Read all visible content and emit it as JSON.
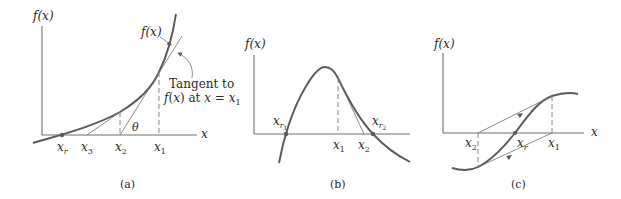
{
  "figure": {
    "panels": [
      {
        "id": "a",
        "caption": "(a)",
        "y_axis_label": "f(x)",
        "x_axis_label": "x",
        "curve_label": "f(x)",
        "tangent_label_line1": "Tangent to",
        "tangent_label_line2": "f(x) at x = x",
        "tangent_label_sub": "1",
        "angle_label": "θ",
        "points": {
          "xr": {
            "base": "x",
            "sub": "r"
          },
          "x3": {
            "base": "x",
            "sub": "3"
          },
          "x2": {
            "base": "x",
            "sub": "2"
          },
          "x1": {
            "base": "x",
            "sub": "1"
          }
        }
      },
      {
        "id": "b",
        "caption": "(b)",
        "y_axis_label": "f(x)",
        "x_axis_label": "x",
        "points": {
          "xr1": {
            "base": "x",
            "sub": "r",
            "subsub": "1"
          },
          "x1": {
            "base": "x",
            "sub": "1"
          },
          "x2": {
            "base": "x",
            "sub": "2"
          },
          "xr2": {
            "base": "x",
            "sub": "r",
            "subsub": "2"
          }
        }
      },
      {
        "id": "c",
        "caption": "(c)",
        "y_axis_label": "f(x)",
        "x_axis_label": "x",
        "points": {
          "x2": {
            "base": "x",
            "sub": "2"
          },
          "xr": {
            "base": "x",
            "sub": "r"
          },
          "x1": {
            "base": "x",
            "sub": "1"
          }
        }
      }
    ]
  }
}
